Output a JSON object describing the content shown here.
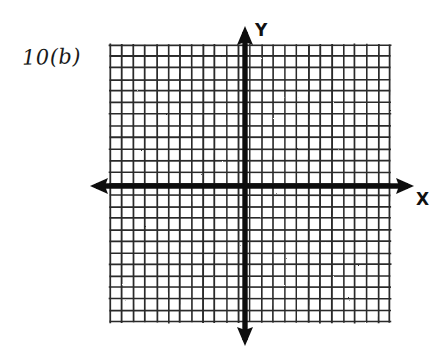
{
  "figure": {
    "title": "10(b)",
    "kind": "hand-drawn blank cartesian coordinate grid",
    "background_color": "#ffffff",
    "ink_color": "#141414",
    "grid_line_color": "#2b2b2b"
  },
  "labels": {
    "problem": "10(b)",
    "x_axis": "X",
    "y_axis": "Y"
  },
  "chart_data": {
    "type": "scatter",
    "title": "10(b)",
    "xlabel": "X",
    "ylabel": "Y",
    "grid": true,
    "legend": "none",
    "series": [],
    "x": [],
    "y": [],
    "xlim": [
      -12,
      12
    ],
    "ylim": [
      -12,
      12
    ],
    "xticks": [],
    "yticks": [],
    "annotations": []
  },
  "geometry": {
    "grid_left": 110,
    "grid_right": 390,
    "grid_top": 45,
    "grid_bottom": 322,
    "cell_size": 11.55,
    "columns": 24,
    "rows": 24,
    "origin_x": 245,
    "origin_y": 186,
    "axis_stroke_width": 5,
    "grid_stroke_width": 1.6,
    "x_arrow_left_tip": 90,
    "x_arrow_right_tip": 414,
    "y_arrow_top_tip": 26,
    "y_arrow_bottom_tip": 346
  }
}
